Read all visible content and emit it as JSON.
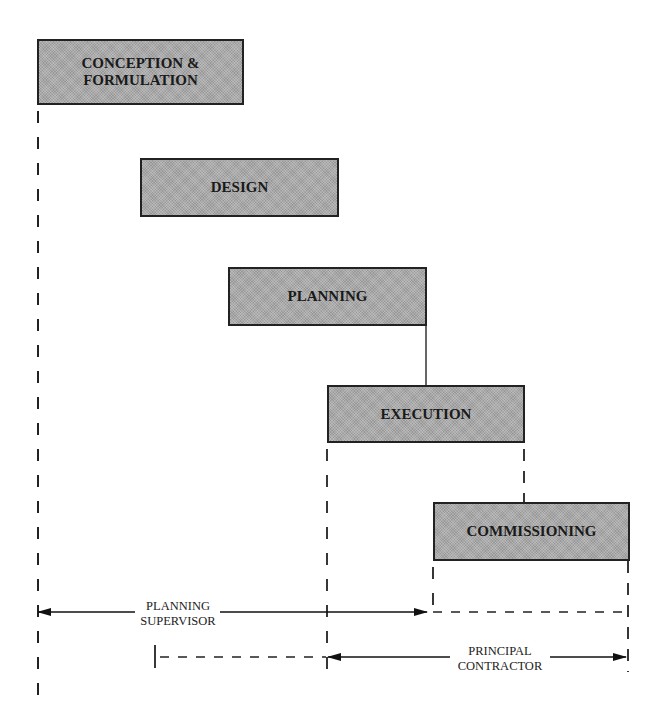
{
  "diagram": {
    "stages": [
      {
        "id": "conception",
        "label": "CONCEPTION &\nFORMULATION",
        "x": 37,
        "y": 39,
        "w": 207,
        "h": 66
      },
      {
        "id": "design",
        "label": "DESIGN",
        "x": 140,
        "y": 158,
        "w": 199,
        "h": 59
      },
      {
        "id": "planning",
        "label": "PLANNING",
        "x": 228,
        "y": 267,
        "w": 199,
        "h": 59
      },
      {
        "id": "execution",
        "label": "EXECUTION",
        "x": 327,
        "y": 385,
        "w": 198,
        "h": 58
      },
      {
        "id": "commissioning",
        "label": "COMMISSIONING",
        "x": 433,
        "y": 502,
        "w": 197,
        "h": 59
      }
    ],
    "roles": [
      {
        "id": "planning-supervisor",
        "label": "PLANNING\nSUPERVISOR",
        "arrow_from_x": 37,
        "arrow_to_x": 427,
        "dashed_to_x": 628,
        "y": 612
      },
      {
        "id": "principal-contractor",
        "label": "PRINCIPAL\nCONTRACTOR",
        "arrow_from_x": 327,
        "arrow_to_x": 628,
        "dashed_from_x": 155,
        "y": 657
      }
    ],
    "colors": {
      "box_fill": "#a9a9a9",
      "line": "#222222",
      "background": "#ffffff"
    }
  }
}
